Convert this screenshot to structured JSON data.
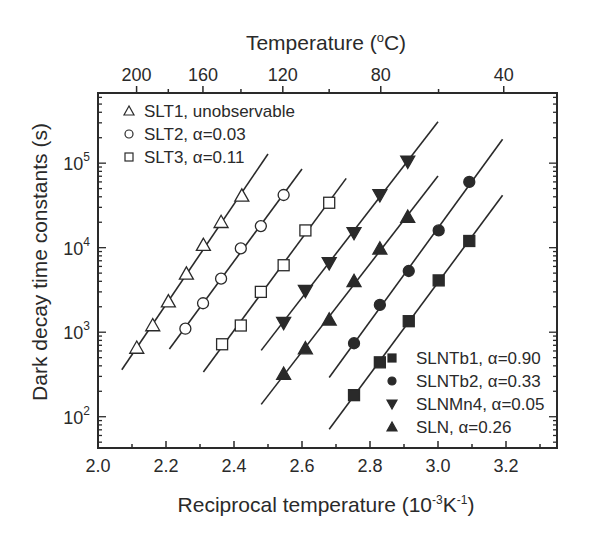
{
  "chart_data": {
    "type": "scatter",
    "title": "",
    "xlabel": "Reciprocal temperature (10^-3 K^-1)",
    "xlabel_parts": {
      "main": "Reciprocal temperature (10",
      "sup1": "-3",
      "mid": "K",
      "sup2": "-1",
      "end": ")"
    },
    "ylabel": "Dark decay time constants (s)",
    "top_xlabel": "Temperature (oC)",
    "top_xlabel_parts": {
      "main": "Temperature (",
      "sup": "o",
      "end": "C)"
    },
    "xlim": [
      2.0,
      3.35
    ],
    "ylim_log10": [
      1.63,
      5.83
    ],
    "yscale": "log",
    "grid": false,
    "x_ticks": [
      2.0,
      2.2,
      2.4,
      2.6,
      2.8,
      3.0,
      3.2
    ],
    "x_tick_labels": [
      "2.0",
      "2.2",
      "2.4",
      "2.6",
      "2.8",
      "3.0",
      "3.2"
    ],
    "y_ticks_log10": [
      2,
      3,
      4,
      5
    ],
    "y_tick_labels": [
      "10",
      "10",
      "10",
      "10"
    ],
    "y_tick_label_exponents": [
      "2",
      "3",
      "4",
      "5"
    ],
    "top_x_ticks_celsius": [
      200,
      160,
      120,
      80,
      40
    ],
    "top_x_tick_labels": [
      "200",
      "160",
      "120",
      "80",
      "40"
    ],
    "top_x_minor_celsius": [
      180,
      140,
      100,
      60
    ],
    "legend_top_left": [
      {
        "series": 0,
        "label": "SLT1, unobservable"
      },
      {
        "series": 1,
        "label": "SLT2, α=0.03"
      },
      {
        "series": 2,
        "label": "SLT3, α=0.11"
      }
    ],
    "legend_bottom_right": [
      {
        "series": 6,
        "label": "SLNTb1, α=0.90"
      },
      {
        "series": 5,
        "label": "SLNTb2, α=0.33"
      },
      {
        "series": 3,
        "label": "SLNMn4, α=0.05"
      },
      {
        "series": 4,
        "label": "SLN,        α=0.26"
      }
    ],
    "series": [
      {
        "name": "SLT1",
        "alpha": "unobservable",
        "marker": "triangle-up-open",
        "x": [
          2.114,
          2.161,
          2.207,
          2.26,
          2.31,
          2.362,
          2.423
        ],
        "y": [
          650,
          1200,
          2300,
          4900,
          10700,
          20000,
          41000
        ],
        "fit_x": [
          2.07,
          2.5
        ]
      },
      {
        "name": "SLT2",
        "alpha": 0.03,
        "marker": "circle-open",
        "x": [
          2.257,
          2.309,
          2.362,
          2.42,
          2.479,
          2.546
        ],
        "y": [
          1100,
          2200,
          4300,
          9800,
          18000,
          42000
        ],
        "fit_x": [
          2.21,
          2.6
        ]
      },
      {
        "name": "SLT3",
        "alpha": 0.11,
        "marker": "square-open",
        "x": [
          2.365,
          2.42,
          2.479,
          2.546,
          2.61,
          2.68
        ],
        "y": [
          720,
          1200,
          3000,
          6200,
          16000,
          34000
        ],
        "fit_x": [
          2.31,
          2.73
        ]
      },
      {
        "name": "SLNMn4",
        "alpha": 0.05,
        "marker": "triangle-down-filled",
        "x": [
          2.546,
          2.61,
          2.68,
          2.753,
          2.829,
          2.911
        ],
        "y": [
          1300,
          3100,
          6600,
          15000,
          42000,
          105000
        ],
        "fit_x": [
          2.48,
          3.0
        ]
      },
      {
        "name": "SLN",
        "alpha": 0.26,
        "marker": "triangle-up-filled",
        "x": [
          2.546,
          2.61,
          2.68,
          2.753,
          2.829,
          2.911
        ],
        "y": [
          320,
          640,
          1400,
          4000,
          9700,
          23000
        ],
        "fit_x": [
          2.48,
          3.0
        ]
      },
      {
        "name": "SLNTb2",
        "alpha": 0.33,
        "marker": "circle-filled",
        "x": [
          2.753,
          2.829,
          2.914,
          3.002,
          3.092
        ],
        "y": [
          740,
          2100,
          5300,
          16000,
          60000
        ],
        "fit_x": [
          2.68,
          3.19
        ]
      },
      {
        "name": "SLNTb1",
        "alpha": 0.9,
        "marker": "square-filled",
        "x": [
          2.753,
          2.829,
          2.914,
          3.002,
          3.092
        ],
        "y": [
          180,
          440,
          1350,
          4100,
          12000
        ],
        "fit_x": [
          2.68,
          3.19
        ]
      }
    ]
  }
}
